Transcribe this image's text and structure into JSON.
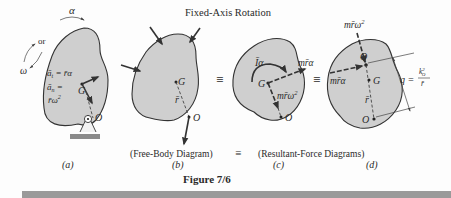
{
  "figure": {
    "title": "Fixed-Axis Rotation",
    "caption": "Figure 7/6",
    "colors": {
      "body_fill": "#cfcfcf",
      "outline": "#333333",
      "ground": "#8a8a8a",
      "bottom_bar": "#9a9a9a"
    }
  },
  "panels": [
    {
      "id": "a",
      "label": "(a)",
      "angular_accel_label": "α",
      "or_label": "or",
      "omega_label": "ω",
      "at_eq": "ā",
      "at_sub": "t",
      "at_rhs": " = r̄α",
      "an_eq": "ā",
      "an_sub": "n",
      "an_rhs": " =",
      "an_rhs2": "r̄ω",
      "an_exp": "2",
      "point_G": "G",
      "point_O": "O"
    },
    {
      "id": "b",
      "label": "(b)",
      "point_G": "G",
      "point_O": "O",
      "r_label": "r̄"
    },
    {
      "id": "c",
      "label": "(c)",
      "moment_label": "Īα",
      "tangential_force": "mr̄α",
      "normal_force": "mr̄ω",
      "normal_exp": "2",
      "point_G": "G",
      "point_O": "O"
    },
    {
      "id": "d",
      "label": "(d)",
      "normal_force": "mr̄ω",
      "normal_exp": "2",
      "tangential_force": "mr̄α",
      "point_Q": "Q",
      "point_G": "G",
      "point_O": "O",
      "r_label": "r̄",
      "q_label": "q =",
      "q_num": "k",
      "q_num_sup": "2",
      "q_num_sub": "O",
      "q_den": "r̄"
    }
  ],
  "groupings": {
    "free_body": "(Free-Body Diagram)",
    "equiv": "≡",
    "resultant": "(Resultant-Force Diagrams)"
  },
  "equivalence_symbol": "≡"
}
